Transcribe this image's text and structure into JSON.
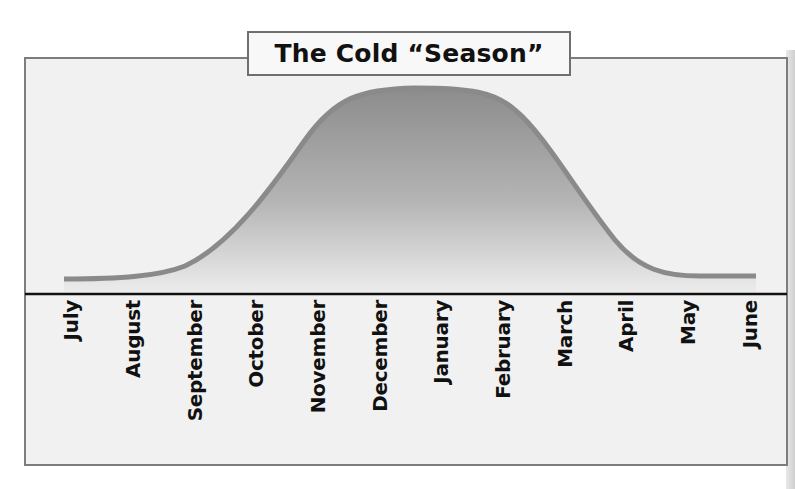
{
  "title": "The Cold “Season”",
  "chart_data": {
    "type": "area",
    "title": "The Cold “Season”",
    "xlabel": "",
    "ylabel": "",
    "categories": [
      "July",
      "August",
      "September",
      "October",
      "November",
      "December",
      "January",
      "February",
      "March",
      "April",
      "May",
      "June"
    ],
    "values": [
      2,
      5,
      15,
      45,
      85,
      100,
      100,
      95,
      60,
      20,
      5,
      2
    ],
    "ylim": [
      0,
      100
    ],
    "grid": false,
    "legend": "none"
  },
  "months": [
    "July",
    "August",
    "September",
    "October",
    "November",
    "December",
    "January",
    "February",
    "March",
    "April",
    "May",
    "June"
  ],
  "colors": {
    "background": "#f1f1f1",
    "frame_border": "#7d7d7d",
    "curve_stroke": "#8c8c8c",
    "fill_top": "#8e8e8e",
    "fill_bottom": "#ececec",
    "axis_line": "#111111"
  }
}
